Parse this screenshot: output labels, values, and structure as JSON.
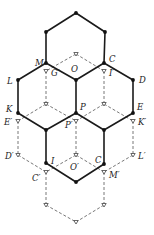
{
  "diagram": {
    "type": "hexagonal-lattice-projection",
    "colors": {
      "solid": "#1a1a1a",
      "dashed": "#555555"
    },
    "solid_vertices": [
      {
        "id": "top",
        "x": 76,
        "y": 13
      },
      {
        "id": "tl",
        "x": 46,
        "y": 32
      },
      {
        "id": "tr",
        "x": 105,
        "y": 32
      },
      {
        "id": "M",
        "x": 46,
        "y": 63
      },
      {
        "id": "C",
        "x": 104,
        "y": 63
      },
      {
        "id": "L",
        "x": 18,
        "y": 80
      },
      {
        "id": "O",
        "x": 76,
        "y": 80
      },
      {
        "id": "D",
        "x": 133,
        "y": 80
      },
      {
        "id": "K",
        "x": 18,
        "y": 113
      },
      {
        "id": "P",
        "x": 76,
        "y": 113
      },
      {
        "id": "E",
        "x": 133,
        "y": 113
      },
      {
        "id": "ml",
        "x": 46,
        "y": 130
      },
      {
        "id": "mr",
        "x": 104,
        "y": 130
      },
      {
        "id": "I",
        "x": 46,
        "y": 163
      },
      {
        "id": "C2",
        "x": 104,
        "y": 164
      },
      {
        "id": "bot",
        "x": 76,
        "y": 182
      }
    ],
    "solid_edges": [
      [
        "top",
        "tl"
      ],
      [
        "top",
        "tr"
      ],
      [
        "tl",
        "M"
      ],
      [
        "tr",
        "C"
      ],
      [
        "M",
        "L"
      ],
      [
        "M",
        "O"
      ],
      [
        "C",
        "O"
      ],
      [
        "C",
        "D"
      ],
      [
        "L",
        "K"
      ],
      [
        "O",
        "P"
      ],
      [
        "D",
        "E"
      ],
      [
        "K",
        "ml"
      ],
      [
        "P",
        "ml"
      ],
      [
        "P",
        "mr"
      ],
      [
        "E",
        "mr"
      ],
      [
        "ml",
        "I"
      ],
      [
        "mr",
        "C2"
      ],
      [
        "I",
        "bot"
      ],
      [
        "C2",
        "bot"
      ]
    ],
    "open_vertices": [
      {
        "id": "o1",
        "x": 76,
        "y": 54
      },
      {
        "id": "Gp",
        "x": 46,
        "y": 71
      },
      {
        "id": "Ip",
        "x": 104,
        "y": 71
      },
      {
        "id": "o2",
        "x": 46,
        "y": 104
      },
      {
        "id": "o3",
        "x": 104,
        "y": 104
      },
      {
        "id": "Ep",
        "x": 18,
        "y": 121
      },
      {
        "id": "Pp",
        "x": 76,
        "y": 121
      },
      {
        "id": "Kp",
        "x": 133,
        "y": 121
      },
      {
        "id": "Dp",
        "x": 18,
        "y": 155
      },
      {
        "id": "Op",
        "x": 76,
        "y": 155
      },
      {
        "id": "Lp",
        "x": 133,
        "y": 155
      },
      {
        "id": "Cp",
        "x": 46,
        "y": 172
      },
      {
        "id": "Mp",
        "x": 104,
        "y": 172
      },
      {
        "id": "b1",
        "x": 46,
        "y": 205
      },
      {
        "id": "b2",
        "x": 104,
        "y": 205
      },
      {
        "id": "b3",
        "x": 76,
        "y": 222
      }
    ],
    "dashed_edges": [
      [
        "o1",
        "Gp"
      ],
      [
        "o1",
        "Ip"
      ],
      [
        "Gp",
        "o2"
      ],
      [
        "Ip",
        "o3"
      ],
      [
        "o2",
        "Ep"
      ],
      [
        "o2",
        "Pp"
      ],
      [
        "o3",
        "Pp"
      ],
      [
        "o3",
        "Kp"
      ],
      [
        "Ep",
        "Dp"
      ],
      [
        "Pp",
        "Op"
      ],
      [
        "Kp",
        "Lp"
      ],
      [
        "Dp",
        "Cp"
      ],
      [
        "Op",
        "Cp"
      ],
      [
        "Op",
        "Mp"
      ],
      [
        "Lp",
        "Mp"
      ],
      [
        "Cp",
        "b1"
      ],
      [
        "Mp",
        "b2"
      ],
      [
        "b1",
        "b3"
      ],
      [
        "b2",
        "b3"
      ]
    ],
    "labels": [
      {
        "text": "M",
        "x": 35,
        "y": 66
      },
      {
        "text": "G′",
        "x": 51,
        "y": 76
      },
      {
        "text": "O",
        "x": 71,
        "y": 72
      },
      {
        "text": "C",
        "x": 109,
        "y": 62
      },
      {
        "text": "I′",
        "x": 109,
        "y": 76
      },
      {
        "text": "D",
        "x": 139,
        "y": 83
      },
      {
        "text": "L",
        "x": 7,
        "y": 84
      },
      {
        "text": "K",
        "x": 6,
        "y": 112
      },
      {
        "text": "E′",
        "x": 4,
        "y": 125
      },
      {
        "text": "P",
        "x": 80,
        "y": 110
      },
      {
        "text": "P′",
        "x": 65,
        "y": 128
      },
      {
        "text": "E",
        "x": 137,
        "y": 110
      },
      {
        "text": "K′",
        "x": 138,
        "y": 125
      },
      {
        "text": "D′",
        "x": 5,
        "y": 159
      },
      {
        "text": "I",
        "x": 51,
        "y": 164
      },
      {
        "text": "O′",
        "x": 70,
        "y": 170
      },
      {
        "text": "C",
        "x": 95,
        "y": 163
      },
      {
        "text": "L′",
        "x": 138,
        "y": 159
      },
      {
        "text": "C′",
        "x": 32,
        "y": 181
      },
      {
        "text": "M′",
        "x": 109,
        "y": 178
      }
    ]
  }
}
